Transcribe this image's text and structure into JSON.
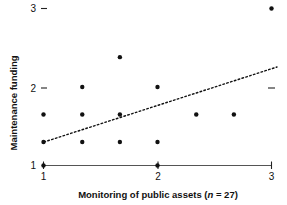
{
  "chart_data": {
    "type": "scatter",
    "title": "",
    "xlabel": "Monitoring of public assets (n = 27)",
    "xlabel_prefix": "Monitoring of public assets (",
    "xlabel_italic": "n",
    "xlabel_suffix": " = 27)",
    "ylabel": "Maintenance funding",
    "sample_size": 27,
    "xlim": [
      1,
      3
    ],
    "ylim": [
      1,
      3
    ],
    "xticks": [
      1,
      2,
      3
    ],
    "xticklabels": [
      "1",
      "2",
      "3"
    ],
    "yticks": [
      1,
      2,
      3
    ],
    "yticklabels": [
      "1",
      "2",
      "3"
    ],
    "grid": false,
    "legend": false,
    "points": [
      {
        "x": 1.0,
        "y": 1.0
      },
      {
        "x": 2.0,
        "y": 1.0
      },
      {
        "x": 1.0,
        "y": 1.3
      },
      {
        "x": 1.34,
        "y": 1.3
      },
      {
        "x": 1.67,
        "y": 1.3
      },
      {
        "x": 2.0,
        "y": 1.3
      },
      {
        "x": 1.0,
        "y": 1.65
      },
      {
        "x": 1.34,
        "y": 1.65
      },
      {
        "x": 1.67,
        "y": 1.65
      },
      {
        "x": 2.34,
        "y": 1.65
      },
      {
        "x": 2.67,
        "y": 1.65
      },
      {
        "x": 1.34,
        "y": 2.0
      },
      {
        "x": 2.0,
        "y": 2.0
      },
      {
        "x": 1.67,
        "y": 2.38
      },
      {
        "x": 3.0,
        "y": 3.0
      }
    ],
    "trend_line": {
      "style": "dotted",
      "x_start": 1.0,
      "y_start": 1.3,
      "x_end": 2.95,
      "y_end": 2.12
    },
    "right_edge_ticks": [
      2
    ]
  }
}
